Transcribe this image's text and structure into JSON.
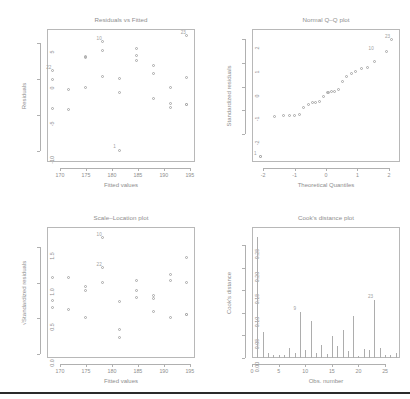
{
  "figure": {
    "kind": "regression-diagnostic-plots",
    "background": "#ffffff",
    "ink": "#9a9a9a",
    "panel_count": 4
  },
  "chart_data": [
    {
      "type": "scatter",
      "id": "residuals-vs-fitted",
      "title": "Residuals vs Fitted",
      "xlabel": "Fitted values",
      "ylabel": "Residuals",
      "xlim": [
        167.5,
        196.0
      ],
      "ylim": [
        -11.5,
        7.0
      ],
      "xticks": [
        170,
        175,
        180,
        185,
        190,
        195
      ],
      "yticks": [
        5,
        0,
        -5,
        -10
      ],
      "grid": false,
      "legend": null,
      "x": [
        168.6,
        168.6,
        168.6,
        171.7,
        171.7,
        175.0,
        175.0,
        175.0,
        178.3,
        178.3,
        178.3,
        181.5,
        181.5,
        181.5,
        184.8,
        184.8,
        184.8,
        188.0,
        188.0,
        188.0,
        191.3,
        191.3,
        191.3,
        194.5,
        194.5,
        194.5,
        194.5
      ],
      "y": [
        1.2,
        -4.1,
        0.0,
        -1.4,
        -4.3,
        3.2,
        -1.2,
        3.0,
        5.2,
        3.9,
        0.3,
        0.1,
        -1.9,
        -9.9,
        4.3,
        3.3,
        2.6,
        1.9,
        0.8,
        -2.7,
        -1.2,
        -3.4,
        -3.9,
        6.0,
        0.2,
        -3.6,
        -3.6
      ],
      "point_labels": [
        {
          "text": "10",
          "x": 178.3,
          "y": 5.2
        },
        {
          "text": "22",
          "x": 168.6,
          "y": 1.2
        },
        {
          "text": "1",
          "x": 181.5,
          "y": -9.9
        },
        {
          "text": "23",
          "x": 194.5,
          "y": 6.0
        }
      ]
    },
    {
      "type": "scatter",
      "id": "normal-qq",
      "title": "Normal Q–Q plot",
      "xlabel": "Theoretical Quantiles",
      "ylabel": "Standardized residuals",
      "xlim": [
        -2.35,
        2.35
      ],
      "ylim": [
        -3.15,
        2.4
      ],
      "xticks": [
        -2,
        -1,
        0,
        1,
        2
      ],
      "yticks": [
        2,
        1,
        0,
        -1,
        -2
      ],
      "grid": false,
      "legend": null,
      "x": [
        -2.08,
        -2.08,
        -1.62,
        -1.35,
        -1.15,
        -0.98,
        -0.83,
        -0.69,
        -0.56,
        -0.43,
        -0.31,
        -0.19,
        -0.07,
        0.05,
        0.17,
        0.29,
        0.41,
        0.54,
        0.67,
        0.81,
        0.96,
        1.13,
        1.32,
        1.56,
        1.94,
        2.08,
        0.1
      ],
      "y": [
        -2.95,
        -2.95,
        -1.28,
        -1.22,
        -1.22,
        -1.21,
        -1.16,
        -0.9,
        -0.75,
        -0.7,
        -0.68,
        -0.62,
        -0.42,
        -0.28,
        -0.22,
        -0.2,
        -0.12,
        0.18,
        0.4,
        0.52,
        0.62,
        0.72,
        0.8,
        1.05,
        1.45,
        1.95,
        -0.25
      ],
      "point_labels": [
        {
          "text": "1",
          "x": -2.08,
          "y": -2.95
        },
        {
          "text": "10",
          "x": 1.56,
          "y": 1.45
        },
        {
          "text": "23",
          "x": 2.08,
          "y": 1.95
        }
      ]
    },
    {
      "type": "scatter",
      "id": "scale-location",
      "title": "Scale–Location plot",
      "xlabel": "Fitted values",
      "ylabel": "√Standardized residuals",
      "xlim": [
        167.5,
        196.0
      ],
      "ylim": [
        -0.06,
        1.78
      ],
      "xticks": [
        170,
        175,
        180,
        185,
        190,
        195
      ],
      "yticks": [
        "0.0",
        "0.5",
        "1.0",
        "1.5"
      ],
      "grid": false,
      "legend": null,
      "x": [
        168.6,
        168.6,
        168.6,
        171.7,
        171.7,
        175.0,
        175.0,
        175.0,
        178.3,
        178.3,
        178.3,
        181.5,
        181.5,
        181.5,
        184.8,
        184.8,
        184.8,
        188.0,
        188.0,
        188.0,
        191.3,
        191.3,
        191.3,
        194.5,
        194.5,
        194.5,
        194.5
      ],
      "y": [
        1.07,
        0.74,
        0.65,
        1.06,
        0.61,
        0.94,
        0.89,
        0.51,
        1.2,
        1.63,
        1.0,
        0.73,
        0.34,
        0.22,
        1.03,
        0.88,
        0.79,
        0.82,
        0.77,
        0.59,
        1.11,
        1.02,
        0.51,
        1.35,
        1.0,
        0.54,
        0.54
      ],
      "point_labels": [
        {
          "text": "10",
          "x": 178.3,
          "y": 1.63
        },
        {
          "text": "22",
          "x": 178.3,
          "y": 1.2
        }
      ]
    },
    {
      "type": "bar",
      "id": "cooks-distance",
      "title": "Cook's distance plot",
      "xlabel": "Obs. number",
      "ylabel": "Cook's distance",
      "xlim": [
        0.0,
        27.8
      ],
      "ylim": [
        0.0,
        0.29
      ],
      "xticks": [
        0,
        5,
        10,
        15,
        20,
        25
      ],
      "yticks": [
        "0.00",
        "0.05",
        "0.10",
        "0.15",
        "0.20",
        "0.25"
      ],
      "grid": false,
      "legend": null,
      "categories": [
        1,
        2,
        3,
        4,
        5,
        6,
        7,
        8,
        9,
        10,
        11,
        12,
        13,
        14,
        15,
        16,
        17,
        18,
        19,
        20,
        21,
        22,
        23,
        24,
        25,
        26,
        27
      ],
      "values": [
        0.268,
        0.057,
        0.01,
        0.007,
        0.007,
        0.006,
        0.023,
        0.01,
        0.101,
        0.017,
        0.081,
        0.012,
        0.029,
        0.009,
        0.049,
        0.026,
        0.063,
        0.016,
        0.093,
        0.004,
        0.021,
        0.018,
        0.128,
        0.022,
        0.006,
        0.007,
        0.011
      ],
      "point_labels": [
        {
          "text": "9",
          "x": 9,
          "y": 0.101
        },
        {
          "text": "23",
          "x": 23,
          "y": 0.128
        }
      ]
    }
  ]
}
